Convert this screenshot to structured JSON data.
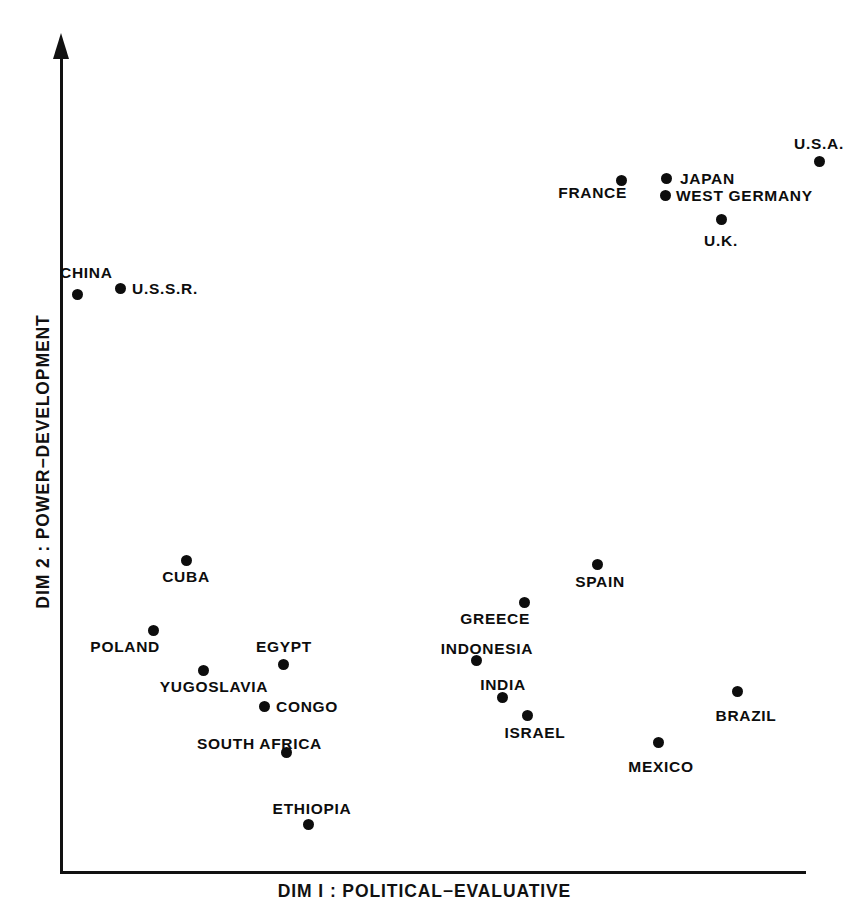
{
  "figure": {
    "background_color": "#ffffff",
    "ink_color": "#0d0d0d"
  },
  "axes": {
    "x_title": "DIM I : POLITICAL−EVALUATIVE",
    "y_title": "DIM 2 : POWER−DEVELOPMENT"
  },
  "chart_data": {
    "type": "scatter",
    "title": "",
    "xlabel": "DIM I : POLITICAL−EVALUATIVE",
    "ylabel": "DIM 2 : POWER−DEVELOPMENT",
    "grid": false,
    "legend": "none",
    "axis_style": "open axes, y-axis with arrowhead, no tick marks, no tick labels",
    "xlim": [
      0,
      1
    ],
    "ylim": [
      0,
      1
    ],
    "note": "x_px / y_px are pixel coordinates of each plotted marker in the 849x916 image; x_norm / y_norm are normalized within the axis box (origin at bottom-left of drawn axes).",
    "points": [
      {
        "label": "U.S.A.",
        "x_px": 819,
        "y_px": 161,
        "x_norm": 1.0,
        "y_norm": 0.871,
        "label_pos": "above",
        "label_x_px": 819,
        "label_y_px": 143
      },
      {
        "label": "JAPAN",
        "x_px": 666,
        "y_px": 178,
        "x_norm": 0.795,
        "y_norm": 0.85,
        "label_pos": "right",
        "label_x_px": 680,
        "label_y_px": 178
      },
      {
        "label": "FRANCE",
        "x_px": 621,
        "y_px": 180,
        "x_norm": 0.734,
        "y_norm": 0.848,
        "label_pos": "below-left",
        "label_x_px": 627,
        "label_y_px": 192
      },
      {
        "label": "WEST GERMANY",
        "x_px": 665,
        "y_px": 195,
        "x_norm": 0.793,
        "y_norm": 0.829,
        "label_pos": "right",
        "label_x_px": 676,
        "label_y_px": 195
      },
      {
        "label": "U.K.",
        "x_px": 721,
        "y_px": 219,
        "x_norm": 0.869,
        "y_norm": 0.8,
        "label_pos": "below",
        "label_x_px": 721,
        "label_y_px": 240
      },
      {
        "label": "U.S.S.R.",
        "x_px": 120,
        "y_px": 288,
        "x_norm": 0.08,
        "y_norm": 0.715,
        "label_pos": "right",
        "label_x_px": 132,
        "label_y_px": 288
      },
      {
        "label": "CHINA",
        "x_px": 77,
        "y_px": 294,
        "x_norm": 0.023,
        "y_norm": 0.708,
        "label_pos": "above-left",
        "label_x_px": 60,
        "label_y_px": 272
      },
      {
        "label": "CUBA",
        "x_px": 186,
        "y_px": 560,
        "x_norm": 0.169,
        "y_norm": 0.382,
        "label_pos": "below",
        "label_x_px": 186,
        "label_y_px": 576
      },
      {
        "label": "SPAIN",
        "x_px": 597,
        "y_px": 564,
        "x_norm": 0.72,
        "y_norm": 0.377,
        "label_pos": "below",
        "label_x_px": 600,
        "label_y_px": 581
      },
      {
        "label": "GREECE",
        "x_px": 524,
        "y_px": 602,
        "x_norm": 0.622,
        "y_norm": 0.33,
        "label_pos": "below-left",
        "label_x_px": 530,
        "label_y_px": 618
      },
      {
        "label": "POLAND",
        "x_px": 153,
        "y_px": 630,
        "x_norm": 0.125,
        "y_norm": 0.296,
        "label_pos": "below-left",
        "label_x_px": 160,
        "label_y_px": 646
      },
      {
        "label": "INDONESIA",
        "x_px": 476,
        "y_px": 660,
        "x_norm": 0.557,
        "y_norm": 0.26,
        "label_pos": "above",
        "label_x_px": 487,
        "label_y_px": 648
      },
      {
        "label": "EGYPT",
        "x_px": 283,
        "y_px": 664,
        "x_norm": 0.299,
        "y_norm": 0.255,
        "label_pos": "above",
        "label_x_px": 284,
        "label_y_px": 646
      },
      {
        "label": "YUGOSLAVIA",
        "x_px": 203,
        "y_px": 670,
        "x_norm": 0.192,
        "y_norm": 0.247,
        "label_pos": "below",
        "label_x_px": 214,
        "label_y_px": 686
      },
      {
        "label": "BRAZIL",
        "x_px": 737,
        "y_px": 691,
        "x_norm": 0.907,
        "y_norm": 0.222,
        "label_pos": "below",
        "label_x_px": 746,
        "label_y_px": 715
      },
      {
        "label": "INDIA",
        "x_px": 502,
        "y_px": 697,
        "x_norm": 0.592,
        "y_norm": 0.215,
        "label_pos": "above",
        "label_x_px": 503,
        "label_y_px": 684
      },
      {
        "label": "CONGO",
        "x_px": 264,
        "y_px": 706,
        "x_norm": 0.273,
        "y_norm": 0.204,
        "label_pos": "right",
        "label_x_px": 276,
        "label_y_px": 706
      },
      {
        "label": "ISRAEL",
        "x_px": 527,
        "y_px": 715,
        "x_norm": 0.626,
        "y_norm": 0.193,
        "label_pos": "below",
        "label_x_px": 535,
        "label_y_px": 732
      },
      {
        "label": "MEXICO",
        "x_px": 658,
        "y_px": 742,
        "x_norm": 0.801,
        "y_norm": 0.16,
        "label_pos": "below",
        "label_x_px": 661,
        "label_y_px": 766
      },
      {
        "label": "SOUTH AFRICA",
        "x_px": 286,
        "y_px": 752,
        "x_norm": 0.303,
        "y_norm": 0.148,
        "label_pos": "above",
        "label_x_px": 322,
        "label_y_px": 743
      },
      {
        "label": "ETHIOPIA",
        "x_px": 308,
        "y_px": 824,
        "x_norm": 0.332,
        "y_norm": 0.06,
        "label_pos": "above",
        "label_x_px": 312,
        "label_y_px": 808
      }
    ]
  }
}
